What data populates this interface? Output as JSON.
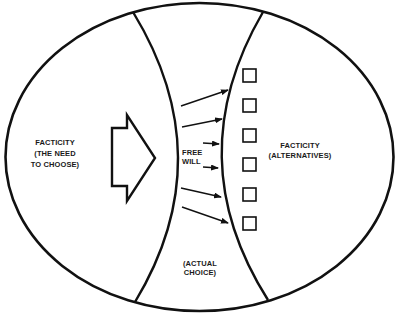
{
  "diagram": {
    "type": "conceptual-ellipse-diagram",
    "stroke_color": "#111111",
    "background": "#ffffff",
    "regions": {
      "left": {
        "lines": [
          "FACTICITY",
          "(THE NEED",
          "TO CHOOSE)"
        ]
      },
      "center": {
        "label_lines": [
          "FREE",
          "WILL"
        ],
        "bottom_lines": [
          "(ACTUAL",
          "CHOICE)"
        ]
      },
      "right": {
        "lines": [
          "FACTICITY",
          "(ALTERNATIVES)"
        ]
      }
    },
    "large_arrow": {
      "direction": "right",
      "style": "outlined-block-arrow"
    },
    "arrows": [
      {
        "from": [
          181,
          106
        ],
        "to": [
          228,
          90
        ]
      },
      {
        "from": [
          182,
          127
        ],
        "to": [
          222,
          119
        ]
      },
      {
        "from": [
          203,
          143
        ],
        "to": [
          219,
          144
        ]
      },
      {
        "from": [
          203,
          167
        ],
        "to": [
          218,
          168
        ]
      },
      {
        "from": [
          181,
          188
        ],
        "to": [
          221,
          197
        ]
      },
      {
        "from": [
          182,
          207
        ],
        "to": [
          228,
          223
        ]
      }
    ],
    "alternative_boxes": [
      {
        "y": 69
      },
      {
        "y": 99
      },
      {
        "y": 129
      },
      {
        "y": 158
      },
      {
        "y": 188
      },
      {
        "y": 217
      }
    ]
  }
}
